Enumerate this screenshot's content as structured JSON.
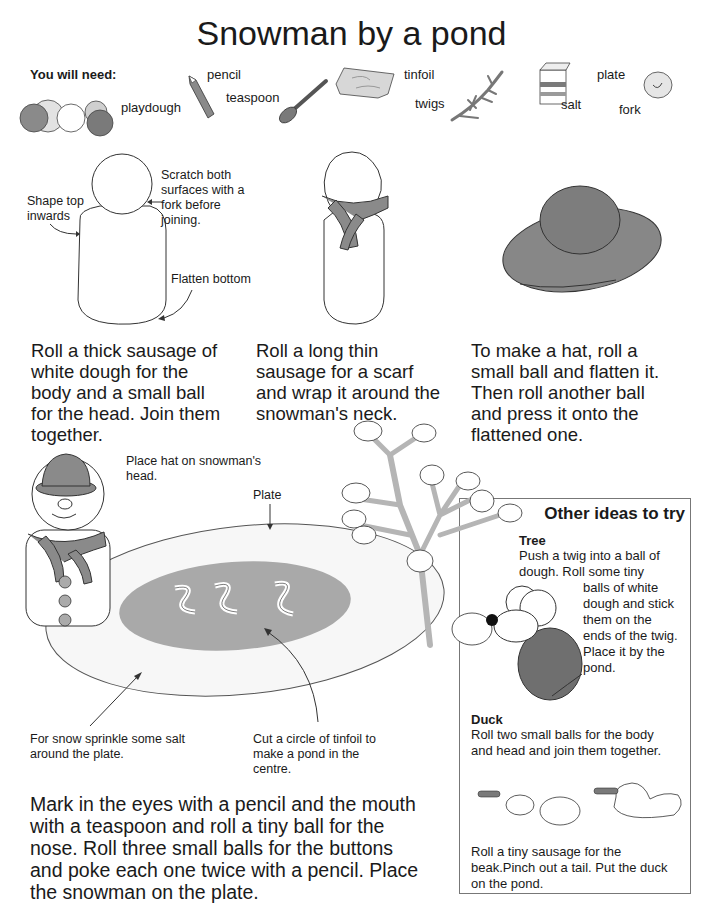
{
  "page": {
    "title": "Snowman by a pond"
  },
  "materials": {
    "heading": "You will need:",
    "items": [
      {
        "label": "playdough",
        "icon": "playdough-balls-icon"
      },
      {
        "label": "pencil",
        "icon": "pencil-icon"
      },
      {
        "label": "teaspoon",
        "icon": "teaspoon-icon"
      },
      {
        "label": "tinfoil",
        "icon": "tinfoil-icon"
      },
      {
        "label": "twigs",
        "icon": "twig-icon"
      },
      {
        "label": "salt",
        "icon": "salt-box-icon"
      },
      {
        "label": "plate",
        "icon": "plate-icon"
      },
      {
        "label": "fork",
        "icon": "fork-icon"
      }
    ]
  },
  "diagram_notes": {
    "shape_top": "Shape top inwards",
    "scratch": "Scratch both surfaces with a fork before joining.",
    "flatten": "Flatten bottom",
    "place_hat": "Place hat on snowman's head.",
    "plate": "Plate",
    "salt_snow": "For snow sprinkle some salt around the plate.",
    "tinfoil_pond": "Cut a circle of tinfoil to make a pond in the centre."
  },
  "steps": [
    {
      "text": "Roll a thick sausage of white dough for the body and a small ball for the head. Join them together."
    },
    {
      "text": "Roll a long thin sausage for a scarf and wrap it around the snowman's neck."
    },
    {
      "text": "To make a hat, roll a small ball and flatten it. Then roll another ball and press it onto the flattened one."
    },
    {
      "text": "Mark in the eyes with a pencil and the mouth with a teaspoon and roll a tiny ball for the nose. Roll three small balls for the buttons and poke each one twice with a pencil. Place the snowman on the plate."
    }
  ],
  "other_ideas": {
    "title": "Other ideas to try",
    "tree": {
      "heading": "Tree",
      "text_top": "Push a twig into a ball of dough. Roll some tiny",
      "text_side": "balls of white dough and stick them on the ends of the twig. Place it by the pond."
    },
    "duck": {
      "heading": "Duck",
      "text_top": "Roll two small balls for the body and head and join them together.",
      "text_bottom": "Roll a tiny sausage for the beak.Pinch out a tail. Put the duck on the pond."
    }
  },
  "colors": {
    "ink": "#1a1a1a",
    "dough_grey": "#8a8a8a",
    "dark_grey": "#6f6f6f",
    "pond_grey": "#a9a9a9",
    "twig_grey": "#b5b5b5"
  }
}
